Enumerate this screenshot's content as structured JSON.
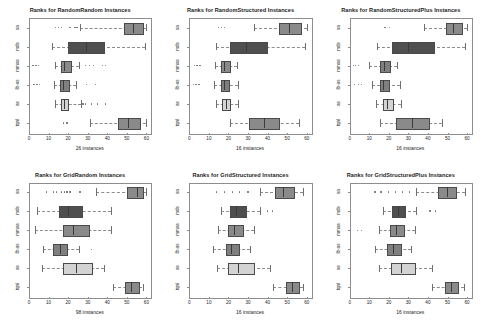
{
  "figure": {
    "rows": 2,
    "cols": 3,
    "background": "#ffffff"
  },
  "chart_data": [
    {
      "type": "boxplot",
      "title": "Ranks for RandomRandom Instances",
      "xlabel": "26 instances",
      "ylabel": "",
      "xlim": [
        0,
        62
      ],
      "xticks": [
        0,
        10,
        20,
        30,
        40,
        50,
        60
      ],
      "categories": [
        "tqnl",
        "as",
        "lb-as",
        "mmas",
        "mds",
        "sa"
      ],
      "grid": false,
      "legend": "none",
      "boxes": [
        {
          "category": "sa",
          "whisker_low": 26.0,
          "q1": 48.5,
          "median": 53.0,
          "q3": 57.5,
          "whisker_high": 60.0,
          "outliers": [
            13.5,
            15.0,
            16.5,
            21.0,
            23.5,
            24.5
          ],
          "fill": "#8a8a8a"
        },
        {
          "category": "mds",
          "whisker_low": 12.0,
          "q1": 20.0,
          "median": 29.0,
          "q3": 38.0,
          "whisker_high": 59.5,
          "outliers": [],
          "fill": "#4f4f4f"
        },
        {
          "category": "mmas",
          "whisker_low": 13.5,
          "q1": 16.5,
          "median": 18.0,
          "q3": 21.0,
          "whisker_high": 25.5,
          "outliers": [
            2.0,
            3.5,
            5.0,
            29.0,
            31.0,
            33.0,
            37.5,
            39.0
          ],
          "fill": "#8a8a8a"
        },
        {
          "category": "lb-as",
          "whisker_low": 13.0,
          "q1": 16.0,
          "median": 17.5,
          "q3": 20.0,
          "whisker_high": 24.0,
          "outliers": [
            2.5,
            4.0,
            5.5,
            29.5,
            34.0
          ],
          "fill": "#7f7f7f"
        },
        {
          "category": "as",
          "whisker_low": 13.5,
          "q1": 16.5,
          "median": 18.0,
          "q3": 19.5,
          "whisker_high": 26.5,
          "outliers": [
            27.5,
            29.0,
            32.0,
            35.0,
            39.0
          ],
          "fill": "#d3d3d3"
        },
        {
          "category": "tqnl",
          "whisker_low": 31.0,
          "q1": 45.5,
          "median": 50.5,
          "q3": 56.0,
          "whisker_high": 60.0,
          "outliers": [
            17.5,
            19.5
          ],
          "fill": "#8a8a8a"
        }
      ]
    },
    {
      "type": "boxplot",
      "title": "Ranks for RandomStructured Instances",
      "xlabel": "16 instances",
      "ylabel": "",
      "xlim": [
        0,
        62
      ],
      "xticks": [
        0,
        10,
        20,
        30,
        40,
        50,
        60
      ],
      "categories": [
        "tqnl",
        "as",
        "lb-as",
        "mmas",
        "mds",
        "sa"
      ],
      "grid": false,
      "legend": "none",
      "boxes": [
        {
          "category": "sa",
          "whisker_low": 33.0,
          "q1": 46.0,
          "median": 51.0,
          "q3": 56.5,
          "whisker_high": 60.0,
          "outliers": [
            15.0,
            16.5,
            18.0
          ],
          "fill": "#8a8a8a"
        },
        {
          "category": "mds",
          "whisker_low": 13.5,
          "q1": 21.0,
          "median": 29.0,
          "q3": 39.0,
          "whisker_high": 59.0,
          "outliers": [],
          "fill": "#4f4f4f"
        },
        {
          "category": "mmas",
          "whisker_low": 13.0,
          "q1": 16.0,
          "median": 17.5,
          "q3": 20.5,
          "whisker_high": 24.5,
          "outliers": [
            2.5,
            4.0,
            5.5
          ],
          "fill": "#8a8a8a"
        },
        {
          "category": "lb-as",
          "whisker_low": 12.5,
          "q1": 16.0,
          "median": 17.5,
          "q3": 20.0,
          "whisker_high": 25.0,
          "outliers": [
            2.0,
            3.5,
            5.0
          ],
          "fill": "#7f7f7f"
        },
        {
          "category": "as",
          "whisker_low": 13.5,
          "q1": 16.5,
          "median": 18.5,
          "q3": 20.5,
          "whisker_high": 25.0,
          "outliers": [],
          "fill": "#d3d3d3"
        },
        {
          "category": "tqnl",
          "whisker_low": 21.0,
          "q1": 30.5,
          "median": 38.0,
          "q3": 45.5,
          "whisker_high": 56.0,
          "outliers": [],
          "fill": "#8a8a8a"
        }
      ]
    },
    {
      "type": "boxplot",
      "title": "Ranks for RandomStructuredPlus Instances",
      "xlabel": "16 instances",
      "ylabel": "",
      "xlim": [
        0,
        62
      ],
      "xticks": [
        0,
        10,
        20,
        30,
        40,
        50,
        60
      ],
      "categories": [
        "tqnl",
        "as",
        "lb-as",
        "mmas",
        "mds",
        "sa"
      ],
      "grid": false,
      "legend": "none",
      "boxes": [
        {
          "category": "sa",
          "whisker_low": 38.0,
          "q1": 49.0,
          "median": 53.0,
          "q3": 57.0,
          "whisker_high": 60.0,
          "outliers": [
            18.0,
            20.5
          ],
          "fill": "#8a8a8a"
        },
        {
          "category": "mds",
          "whisker_low": 14.0,
          "q1": 21.5,
          "median": 30.0,
          "q3": 42.5,
          "whisker_high": 59.0,
          "outliers": [],
          "fill": "#4f4f4f"
        },
        {
          "category": "mmas",
          "whisker_low": 10.0,
          "q1": 15.5,
          "median": 17.5,
          "q3": 20.0,
          "whisker_high": 24.0,
          "outliers": [
            2.0,
            3.0,
            4.5
          ],
          "fill": "#7f7f7f"
        },
        {
          "category": "lb-as",
          "whisker_low": 11.5,
          "q1": 15.5,
          "median": 17.0,
          "q3": 19.5,
          "whisker_high": 25.5,
          "outliers": [
            2.5,
            4.5,
            6.0
          ],
          "fill": "#7f7f7f"
        },
        {
          "category": "as",
          "whisker_low": 13.5,
          "q1": 17.0,
          "median": 19.0,
          "q3": 21.5,
          "whisker_high": 26.0,
          "outliers": [],
          "fill": "#d3d3d3"
        },
        {
          "category": "tqnl",
          "whisker_low": 15.5,
          "q1": 23.5,
          "median": 32.0,
          "q3": 40.0,
          "whisker_high": 47.0,
          "outliers": [],
          "fill": "#8a8a8a"
        }
      ]
    },
    {
      "type": "boxplot",
      "title": "Ranks for GridRandom Instances",
      "xlabel": "98 instances",
      "ylabel": "",
      "xlim": [
        0,
        62
      ],
      "xticks": [
        0,
        10,
        20,
        30,
        40,
        50,
        60
      ],
      "categories": [
        "tqnl",
        "as",
        "lb-as",
        "mmas",
        "mds",
        "sa"
      ],
      "grid": false,
      "legend": "none",
      "boxes": [
        {
          "category": "sa",
          "whisker_low": 34.0,
          "q1": 50.0,
          "median": 55.0,
          "q3": 58.0,
          "whisker_high": 60.0,
          "outliers": [
            9.0,
            12.5,
            14.0,
            16.5,
            18.0,
            19.5,
            21.0,
            26.0
          ],
          "fill": "#8a8a8a"
        },
        {
          "category": "mds",
          "whisker_low": 4.0,
          "q1": 15.5,
          "median": 20.0,
          "q3": 26.5,
          "whisker_high": 42.0,
          "outliers": [],
          "fill": "#4f4f4f"
        },
        {
          "category": "mmas",
          "whisker_low": 3.0,
          "q1": 17.5,
          "median": 22.5,
          "q3": 30.0,
          "whisker_high": 42.0,
          "outliers": [],
          "fill": "#8a8a8a"
        },
        {
          "category": "lb-as",
          "whisker_low": 7.0,
          "q1": 12.5,
          "median": 16.0,
          "q3": 19.0,
          "whisker_high": 25.5,
          "outliers": [
            32.0
          ],
          "fill": "#7f7f7f"
        },
        {
          "category": "as",
          "whisker_low": 6.5,
          "q1": 17.5,
          "median": 24.0,
          "q3": 31.5,
          "whisker_high": 38.5,
          "outliers": [],
          "fill": "#d3d3d3"
        },
        {
          "category": "tqnl",
          "whisker_low": 43.0,
          "q1": 49.0,
          "median": 52.0,
          "q3": 55.5,
          "whisker_high": 58.0,
          "outliers": [],
          "fill": "#8a8a8a"
        }
      ]
    },
    {
      "type": "boxplot",
      "title": "Ranks for GridStructured Instances",
      "xlabel": "16 instances",
      "ylabel": "",
      "xlim": [
        0,
        62
      ],
      "xticks": [
        0,
        10,
        20,
        30,
        40,
        50,
        60
      ],
      "categories": [
        "tqnl",
        "as",
        "lb-as",
        "mmas",
        "mds",
        "sa"
      ],
      "grid": false,
      "legend": "none",
      "boxes": [
        {
          "category": "sa",
          "whisker_low": 36.0,
          "q1": 44.0,
          "median": 48.0,
          "q3": 53.0,
          "whisker_high": 58.0,
          "outliers": [
            14.0,
            18.0,
            22.0,
            25.5,
            30.0
          ],
          "fill": "#8a8a8a"
        },
        {
          "category": "mds",
          "whisker_low": 16.0,
          "q1": 21.0,
          "median": 24.0,
          "q3": 28.5,
          "whisker_high": 36.0,
          "outliers": [
            40.0,
            42.5
          ],
          "fill": "#4f4f4f"
        },
        {
          "category": "mmas",
          "whisker_low": 14.5,
          "q1": 20.0,
          "median": 23.0,
          "q3": 27.0,
          "whisker_high": 33.0,
          "outliers": [],
          "fill": "#8a8a8a"
        },
        {
          "category": "lb-as",
          "whisker_low": 12.0,
          "q1": 18.5,
          "median": 21.5,
          "q3": 25.0,
          "whisker_high": 31.0,
          "outliers": [],
          "fill": "#7f7f7f"
        },
        {
          "category": "as",
          "whisker_low": 14.0,
          "q1": 20.0,
          "median": 25.0,
          "q3": 32.5,
          "whisker_high": 41.0,
          "outliers": [],
          "fill": "#d3d3d3"
        },
        {
          "category": "tqnl",
          "whisker_low": 43.0,
          "q1": 49.5,
          "median": 52.5,
          "q3": 55.5,
          "whisker_high": 58.0,
          "outliers": [],
          "fill": "#8a8a8a"
        }
      ]
    },
    {
      "type": "boxplot",
      "title": "Ranks for GridStructuredPlus Instances",
      "xlabel": "16 instances",
      "ylabel": "",
      "xlim": [
        0,
        62
      ],
      "xticks": [
        0,
        10,
        20,
        30,
        40,
        50,
        60
      ],
      "categories": [
        "tqnl",
        "as",
        "lb-as",
        "mmas",
        "mds",
        "sa"
      ],
      "grid": false,
      "legend": "none",
      "boxes": [
        {
          "category": "sa",
          "whisker_low": 34.0,
          "q1": 45.0,
          "median": 49.5,
          "q3": 54.0,
          "whisker_high": 59.0,
          "outliers": [
            13.0,
            16.0,
            20.0,
            23.5,
            27.0,
            30.5
          ],
          "fill": "#8a8a8a"
        },
        {
          "category": "mds",
          "whisker_low": 17.0,
          "q1": 21.5,
          "median": 24.5,
          "q3": 28.0,
          "whisker_high": 34.0,
          "outliers": [
            41.0,
            44.0
          ],
          "fill": "#4f4f4f"
        },
        {
          "category": "mmas",
          "whisker_low": 15.0,
          "q1": 20.5,
          "median": 23.5,
          "q3": 27.5,
          "whisker_high": 33.5,
          "outliers": [
            4.0,
            6.0
          ],
          "fill": "#8a8a8a"
        },
        {
          "category": "lb-as",
          "whisker_low": 13.0,
          "q1": 19.0,
          "median": 22.0,
          "q3": 25.5,
          "whisker_high": 31.5,
          "outliers": [],
          "fill": "#7f7f7f"
        },
        {
          "category": "as",
          "whisker_low": 15.0,
          "q1": 21.0,
          "median": 26.0,
          "q3": 33.0,
          "whisker_high": 42.0,
          "outliers": [],
          "fill": "#d3d3d3"
        },
        {
          "category": "tqnl",
          "whisker_low": 42.0,
          "q1": 48.5,
          "median": 52.0,
          "q3": 55.0,
          "whisker_high": 58.5,
          "outliers": [],
          "fill": "#8a8a8a"
        }
      ]
    }
  ]
}
